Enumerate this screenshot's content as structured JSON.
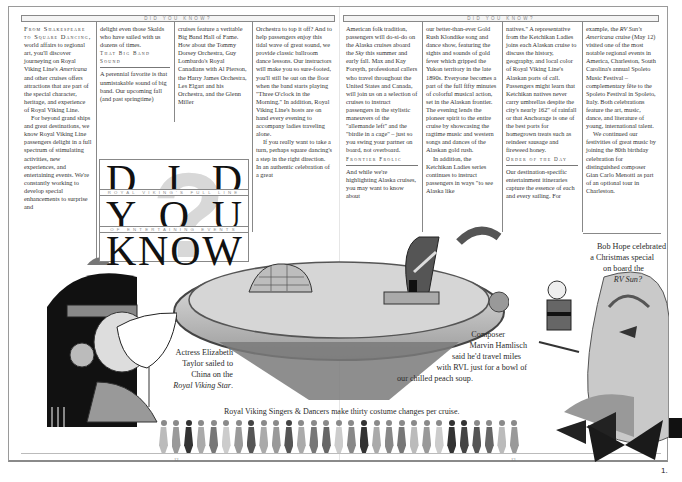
{
  "header": {
    "band_left": "DID YOU KNOW?",
    "band_right": "DID YOU KNOW?"
  },
  "title_block": {
    "row1": [
      "D",
      "I",
      "D"
    ],
    "sub1": "ROYAL VIKING'S FULL LINE",
    "row2": [
      "Y",
      "O",
      "U"
    ],
    "sub2": "OF ENTERTAINING EVENTS",
    "row3": [
      "K",
      "N",
      "O",
      "W"
    ]
  },
  "left_page": {
    "col1": {
      "lead_smallcaps": "From Shakespeare to Square Dancing,",
      "p1": "world affairs to regional art, you'll discover journeying on Royal Viking Line's",
      "p1_italic": "Americana",
      "p1_rest": "and other cruises offers attractions that are part of the special character, heritage, and experience of Royal Viking Line.",
      "p2": "For beyond grand ships and great destinations, we know Royal Viking Line passengers delight in a full spectrum of stimulating activities, new experiences, and entertaining events. We're constantly working to develop special enhancements to surprise and"
    },
    "col2": {
      "p1": "delight even those Skalds who have sailed with us dozens of times.",
      "subhead": "That Big Band Sound",
      "p2": "A perennial favorite is that unmistakable sound of big band. Our upcoming fall (and past springtime)"
    },
    "col3": {
      "p1": "cruises feature a veritable Big Band Hall of Fame. How about the Tommy Dorsey Orchestra, Guy Lombardo's Royal Canadians with Al Pierson, the Harry James Orchestra, Les Elgart and his Orchestra, and the Glenn Miller"
    },
    "col4": {
      "p1": "Orchestra to top it off? And to help passengers enjoy this tidal wave of great sound, we provide classic ballroom dance lessons. Our instructors will make you so sure-footed, you'll still be out on the floor when the band starts playing \"Three O'clock in the Morning.\" In addition, Royal Viking Line's hosts are on hand every evening to accompany ladies traveling alone.",
      "p2": "If you really want to take a turn, perhaps square dancing's a step in the right direction. In an authentic celebration of a great"
    },
    "page_number": "12"
  },
  "right_page": {
    "col1": {
      "p1": "American folk tradition, passengers will do-si-do on the Alaska cruises aboard the",
      "p1_italic": "Sky",
      "p1_rest": "this summer and early fall. Max and Kay Forsyth, professional callers who travel throughout the United States and Canada, will join us on a selection of cruises to instruct passengers in the stylistic maneuvers of the \"allemande left\" and the \"birdie in a cage\" – just so you swing your partner on board, not overboard.",
      "subhead": "Frontier Frolic",
      "p2": "And while we're highlighting Alaska cruises, you may want to know about"
    },
    "col2": {
      "p1": "our better-than-ever Gold Rush Klondike song and dance show, featuring the sights and sounds of gold fever which gripped the Yukon territory in the late 1890s. Everyone becomes a part of the full fifty minutes of colorful musical action, set in the Alaskan frontier. The evening lends the pioneer spirit to the entire cruise by showcasing the ragtime music and western songs and dances of the Alaskan gold rush.",
      "p2": "In addition, the Ketchikan Ladies series continues to instruct passengers in ways \"to see Alaska like"
    },
    "col3": {
      "p1": "natives.\" A representative from the Ketchikan Ladies joins each Alaskan cruise to discuss the history, geography, and local color of Royal Viking Line's Alaskan ports of call. Passengers might learn that Ketchikan natives never carry umbrellas despite the city's nearly 162\" of rainfall or that Anchorage is one of the best ports for homegrown treats such as reindeer sausage and fireweed honey.",
      "subhead": "Order of the Day",
      "p2": "Our destination-specific entertainment itineraries capture the essence of each and every sailing. For"
    },
    "col4": {
      "p1_pre": "example, the",
      "p1_italic": "RV Sun's Americana",
      "p1_rest": "cruise (May 12) visited one of the most notable regional events in America, Charleston, South Carolina's annual Spoleto Music Festival – complementary fête to the Spoleto Festival in Spoleto, Italy. Both celebrations feature the art, music, dance, and literature of young, international talent.",
      "p2": "We continued our festivities of great music by joining the 80th birthday celebration for distinguished composer Gian Carlo Menotti as part of an optional tour in Charleston."
    },
    "page_number": "13"
  },
  "captions": {
    "taylor_l1": "Actress Elizabeth",
    "taylor_l2": "Taylor sailed to",
    "taylor_l3": "China on the",
    "taylor_italic": "Royal Viking Star",
    "hamlisch_l1": "Composer",
    "hamlisch_l2": "Marvin Hamlisch",
    "hamlisch_l3": "said he'd travel miles",
    "hamlisch_l4": "with RVL just for a bowl of",
    "hamlisch_l5": "our chilled peach soup.",
    "hope_l1": "Bob Hope celebrated",
    "hope_l2": "a Christmas special",
    "hope_l3": "on board the",
    "hope_italic": "RV Sun?",
    "dancers": "Royal Viking Singers & Dancers make  thirty costume changes per cruise."
  },
  "footer": {
    "corner_number": "1."
  },
  "colors": {
    "ink": "#2a2a2a",
    "rule": "#888888",
    "band_bg": "#f4f4f4"
  }
}
